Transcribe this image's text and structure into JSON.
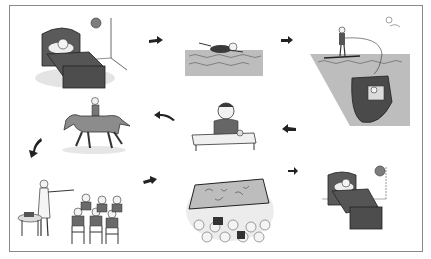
{
  "figure": {
    "type": "picture-sequence",
    "colors": {
      "ink": "#2a2a2a",
      "dark_fill": "#5a5a5a",
      "mid_fill": "#8c8c8c",
      "water": "#bdbdbd",
      "light": "#d6d6d6",
      "frame": "#8a8a8a"
    },
    "panels": [
      {
        "id": 1,
        "scene": "girl sleeping in bed, clock on wall"
      },
      {
        "id": 2,
        "scene": "girl swimming in water"
      },
      {
        "id": 3,
        "scene": "girl water-skiing behind a motorboat"
      },
      {
        "id": 4,
        "scene": "girl eating a meal at a table"
      },
      {
        "id": 5,
        "scene": "girl riding a horse"
      },
      {
        "id": 6,
        "scene": "teacher with class of children at desks"
      },
      {
        "id": 7,
        "scene": "audience watching a cinema screen"
      },
      {
        "id": 8,
        "scene": "girl sleeping in bed, clock on wall"
      }
    ],
    "arrows": [
      {
        "from": 1,
        "to": 2,
        "direction": "right"
      },
      {
        "from": 2,
        "to": 3,
        "direction": "right"
      },
      {
        "from": 3,
        "to": 4,
        "direction": "left"
      },
      {
        "from": 4,
        "to": 5,
        "direction": "left"
      },
      {
        "from": 5,
        "to": 6,
        "direction": "down-left"
      },
      {
        "from": 6,
        "to": 7,
        "direction": "right"
      },
      {
        "from": 7,
        "to": 8,
        "direction": "right"
      }
    ]
  }
}
